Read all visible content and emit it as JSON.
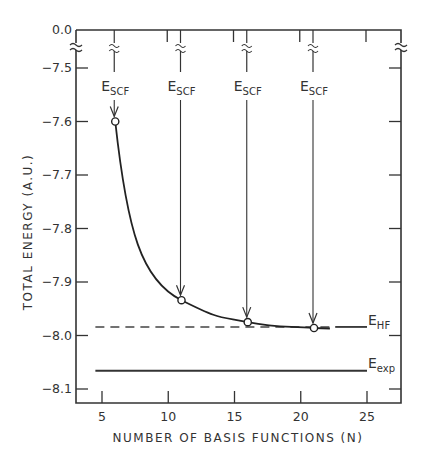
{
  "chart_data": {
    "type": "line",
    "title": "",
    "xlabel": "NUMBER OF BASIS FUNCTIONS (N)",
    "ylabel": "TOTAL ENERGY (A.U.)",
    "xlim": [
      3,
      28
    ],
    "ylim": [
      -8.12,
      0.0
    ],
    "axis_break": "y axis broken between 0.0 and -7.5",
    "x_ticks": [
      5,
      10,
      15,
      20,
      25
    ],
    "x_tick_labels": [
      "5",
      "10",
      "15",
      "20",
      "25"
    ],
    "y_ticks": [
      0.0,
      -7.5,
      -7.6,
      -7.7,
      -7.8,
      -7.9,
      -8.0,
      -8.1
    ],
    "y_tick_labels": [
      "0.0",
      "-7.5",
      "-7.6",
      "-7.7",
      "-7.8",
      "-7.9",
      "-8.0",
      "-8.1"
    ],
    "grid": false,
    "series": [
      {
        "name": "E_SCF",
        "style": "solid curve with open circle markers",
        "x": [
          6,
          11,
          16,
          21
        ],
        "y": [
          -7.6,
          -7.934,
          -7.975,
          -7.986
        ]
      },
      {
        "name": "E_HF",
        "style": "dashed horizontal line (solid segment at right end)",
        "x": [
          4.5,
          25
        ],
        "y": [
          -7.984,
          -7.984
        ]
      },
      {
        "name": "E_exp",
        "style": "solid horizontal line",
        "x": [
          4.5,
          25
        ],
        "y": [
          -8.066,
          -8.066
        ]
      }
    ],
    "annotations": [
      {
        "text": "E_SCF",
        "x": 6,
        "arrow_to_y": -7.6
      },
      {
        "text": "E_SCF",
        "x": 11,
        "arrow_to_y": -7.934
      },
      {
        "text": "E_SCF",
        "x": 16,
        "arrow_to_y": -7.975
      },
      {
        "text": "E_SCF",
        "x": 21,
        "arrow_to_y": -7.986
      },
      {
        "text": "E_HF",
        "at": "right of dashed line"
      },
      {
        "text": "E_exp",
        "at": "right of solid line"
      }
    ],
    "legend": "none (inline labels)"
  },
  "labels": {
    "escf_main": "E",
    "escf_sub": "SCF",
    "ehf_main": "E",
    "ehf_sub": "HF",
    "eexp_main": "E",
    "eexp_sub": "exp",
    "xlabel": "NUMBER OF BASIS FUNCTIONS (N)",
    "ylabel": "TOTAL ENERGY (A.U.)"
  }
}
